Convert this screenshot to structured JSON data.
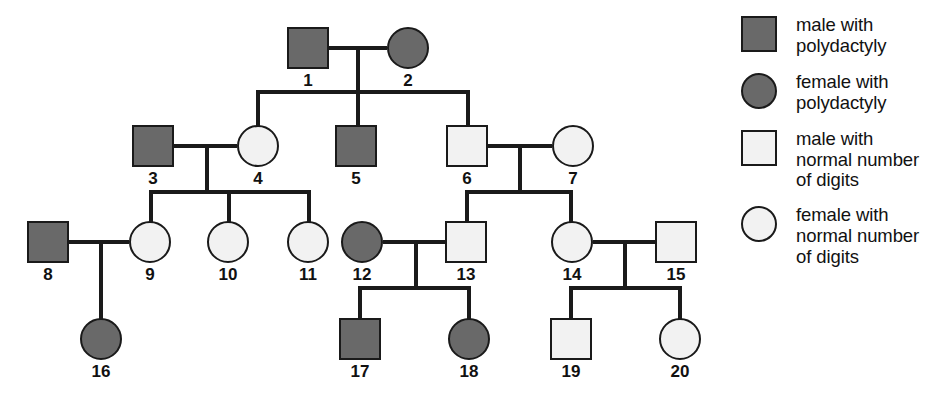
{
  "diagram": {
    "colors": {
      "affected_fill": "#696969",
      "unaffected_fill": "#f2f2f2",
      "line": "#1a1a1a",
      "background": "#ffffff"
    }
  },
  "legend": {
    "items": [
      {
        "key": "male-affected",
        "shape": "square",
        "fill": "filled",
        "label": "male with\npolydactyly",
        "line1": "male with",
        "line2": "polydactyly",
        "line3": ""
      },
      {
        "key": "female-affected",
        "shape": "circle",
        "fill": "filled",
        "label": "female with\npolydactyly",
        "line1": "female with",
        "line2": "polydactyly",
        "line3": ""
      },
      {
        "key": "male-unaffected",
        "shape": "square",
        "fill": "open",
        "label": "male with normal number of digits",
        "line1": "male with",
        "line2": "normal number",
        "line3": "of digits"
      },
      {
        "key": "female-unaffected",
        "shape": "circle",
        "fill": "open",
        "label": "female with normal number of digits",
        "line1": "female with",
        "line2": "normal number",
        "line3": "of digits"
      }
    ]
  },
  "individuals": [
    {
      "id": "1",
      "label": "1",
      "sex": "male",
      "shape": "square",
      "status": "affected",
      "fill": "filled",
      "generation": 1
    },
    {
      "id": "2",
      "label": "2",
      "sex": "female",
      "shape": "circle",
      "status": "affected",
      "fill": "filled",
      "generation": 1
    },
    {
      "id": "3",
      "label": "3",
      "sex": "male",
      "shape": "square",
      "status": "affected",
      "fill": "filled",
      "generation": 2
    },
    {
      "id": "4",
      "label": "4",
      "sex": "female",
      "shape": "circle",
      "status": "unaffected",
      "fill": "open",
      "generation": 2
    },
    {
      "id": "5",
      "label": "5",
      "sex": "male",
      "shape": "square",
      "status": "affected",
      "fill": "filled",
      "generation": 2
    },
    {
      "id": "6",
      "label": "6",
      "sex": "male",
      "shape": "square",
      "status": "unaffected",
      "fill": "open",
      "generation": 2
    },
    {
      "id": "7",
      "label": "7",
      "sex": "female",
      "shape": "circle",
      "status": "unaffected",
      "fill": "open",
      "generation": 2
    },
    {
      "id": "8",
      "label": "8",
      "sex": "male",
      "shape": "square",
      "status": "affected",
      "fill": "filled",
      "generation": 3
    },
    {
      "id": "9",
      "label": "9",
      "sex": "female",
      "shape": "circle",
      "status": "unaffected",
      "fill": "open",
      "generation": 3
    },
    {
      "id": "10",
      "label": "10",
      "sex": "female",
      "shape": "circle",
      "status": "unaffected",
      "fill": "open",
      "generation": 3
    },
    {
      "id": "11",
      "label": "11",
      "sex": "female",
      "shape": "circle",
      "status": "unaffected",
      "fill": "open",
      "generation": 3
    },
    {
      "id": "12",
      "label": "12",
      "sex": "female",
      "shape": "circle",
      "status": "affected",
      "fill": "filled",
      "generation": 3
    },
    {
      "id": "13",
      "label": "13",
      "sex": "male",
      "shape": "square",
      "status": "unaffected",
      "fill": "open",
      "generation": 3
    },
    {
      "id": "14",
      "label": "14",
      "sex": "female",
      "shape": "circle",
      "status": "unaffected",
      "fill": "open",
      "generation": 3
    },
    {
      "id": "15",
      "label": "15",
      "sex": "male",
      "shape": "square",
      "status": "unaffected",
      "fill": "open",
      "generation": 3
    },
    {
      "id": "16",
      "label": "16",
      "sex": "female",
      "shape": "circle",
      "status": "affected",
      "fill": "filled",
      "generation": 4
    },
    {
      "id": "17",
      "label": "17",
      "sex": "male",
      "shape": "square",
      "status": "affected",
      "fill": "filled",
      "generation": 4
    },
    {
      "id": "18",
      "label": "18",
      "sex": "female",
      "shape": "circle",
      "status": "affected",
      "fill": "filled",
      "generation": 4
    },
    {
      "id": "19",
      "label": "19",
      "sex": "male",
      "shape": "square",
      "status": "unaffected",
      "fill": "open",
      "generation": 4
    },
    {
      "id": "20",
      "label": "20",
      "sex": "female",
      "shape": "circle",
      "status": "unaffected",
      "fill": "open",
      "generation": 4
    }
  ],
  "matings": [
    {
      "partners": [
        "1",
        "2"
      ],
      "children": [
        "4",
        "5",
        "6"
      ]
    },
    {
      "partners": [
        "3",
        "4"
      ],
      "children": [
        "9",
        "10",
        "11"
      ]
    },
    {
      "partners": [
        "6",
        "7"
      ],
      "children": [
        "13",
        "14"
      ]
    },
    {
      "partners": [
        "8",
        "9"
      ],
      "children": [
        "16"
      ]
    },
    {
      "partners": [
        "12",
        "13"
      ],
      "children": [
        "17",
        "18"
      ]
    },
    {
      "partners": [
        "14",
        "15"
      ],
      "children": [
        "19",
        "20"
      ]
    }
  ]
}
